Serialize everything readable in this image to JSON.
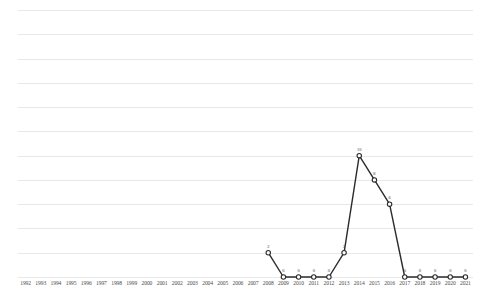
{
  "chart_data": {
    "type": "line",
    "title": "",
    "subtitle": "",
    "xlabel": "",
    "ylabel": "",
    "categories": [
      "1992",
      "1993",
      "1994",
      "1995",
      "1996",
      "1997",
      "1998",
      "1999",
      "2000",
      "2001",
      "2002",
      "2003",
      "2004",
      "2005",
      "2006",
      "2007",
      "2008",
      "2009",
      "2010",
      "2011",
      "2012",
      "2013",
      "2014",
      "2015",
      "2016",
      "2017",
      "2018",
      "2019",
      "2020",
      "2021"
    ],
    "series": [
      {
        "name": "",
        "points": [
          {
            "x": "2008",
            "y": 2,
            "label": "2"
          },
          {
            "x": "2009",
            "y": 0,
            "label": "0"
          },
          {
            "x": "2010",
            "y": 0,
            "label": "0"
          },
          {
            "x": "2011",
            "y": 0,
            "label": "0"
          },
          {
            "x": "2012",
            "y": 0,
            "label": "0"
          },
          {
            "x": "2013",
            "y": 2,
            "label": "2"
          },
          {
            "x": "2014",
            "y": 10,
            "label": "10"
          },
          {
            "x": "2015",
            "y": 8,
            "label": "8"
          },
          {
            "x": "2016",
            "y": 6,
            "label": "6"
          },
          {
            "x": "2017",
            "y": 0,
            "label": "0"
          },
          {
            "x": "2018",
            "y": 0,
            "label": "0"
          },
          {
            "x": "2019",
            "y": 0,
            "label": "0"
          },
          {
            "x": "2020",
            "y": 0,
            "label": "0"
          },
          {
            "x": "2021",
            "y": 0,
            "label": "0"
          }
        ]
      }
    ],
    "ylim": [
      0,
      22
    ],
    "gridlines": [
      0,
      2,
      4,
      6,
      8,
      10,
      12,
      14,
      16,
      18,
      20,
      22
    ],
    "grid": true,
    "y_tick_labels_visible": false,
    "legend": false,
    "legend_position": "none",
    "colors": {
      "line": "#2b2b2b",
      "marker_fill": "#ffffff",
      "marker_stroke": "#2b2b2b",
      "gridline": "#e8e8e8",
      "axis_text": "#4a4a4a",
      "label_text": "#3a3a3a",
      "background": "#ffffff"
    }
  }
}
